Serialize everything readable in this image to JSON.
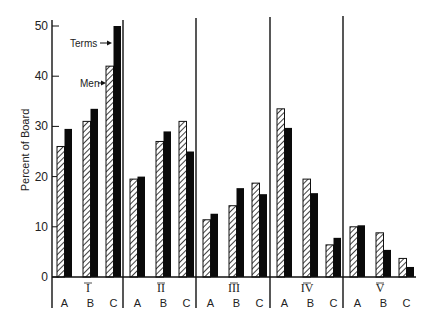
{
  "chart_data": {
    "type": "bar",
    "title": "",
    "xlabel": "",
    "ylabel": "Percent of Board",
    "ylim": [
      0,
      50
    ],
    "yticks": [
      0,
      10,
      20,
      30,
      40,
      50
    ],
    "grid": false,
    "legend_position": "annotations in group I (arrows pointing to bars)",
    "groups": [
      "I",
      "II",
      "III",
      "IV",
      "V"
    ],
    "subcategories": [
      "A",
      "B",
      "C"
    ],
    "categories": [
      "I-A",
      "I-B",
      "I-C",
      "II-A",
      "II-B",
      "II-C",
      "III-A",
      "III-B",
      "III-C",
      "IV-A",
      "IV-B",
      "IV-C",
      "V-A",
      "V-B",
      "V-C"
    ],
    "series": [
      {
        "name": "Men",
        "pattern": "hatched",
        "values": [
          26,
          31,
          42,
          19.5,
          27,
          31,
          11.4,
          14.2,
          18.7,
          33.5,
          19.5,
          6.4,
          10,
          8.8,
          3.7
        ]
      },
      {
        "name": "Terms",
        "pattern": "solid",
        "values": [
          29.5,
          33.5,
          50,
          20,
          29,
          25,
          12.6,
          17.7,
          16.5,
          29.7,
          16.7,
          7.8,
          10.3,
          5.4,
          2
        ]
      }
    ],
    "annotations": [
      {
        "text": "Terms",
        "points_to": "I-C Terms bar"
      },
      {
        "text": "Men",
        "points_to": "I-C Men bar"
      }
    ]
  },
  "labels": {
    "ylabel": "Percent of Board",
    "yticks": [
      "0",
      "10",
      "20",
      "30",
      "40",
      "50"
    ],
    "groups": [
      "I",
      "II",
      "III",
      "IV",
      "V"
    ],
    "sub": [
      "A",
      "B",
      "C"
    ],
    "terms": "Terms",
    "men": "Men"
  }
}
